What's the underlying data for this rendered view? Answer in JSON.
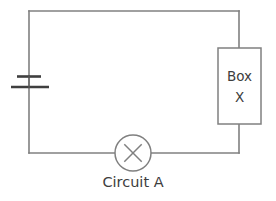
{
  "diagram": {
    "title": "Circuit A",
    "background_color": "#ffffff",
    "wire_color": "#808080",
    "component_color": "#808080",
    "battery_color": "#3f3f3f",
    "text_color": "#3d3d3d",
    "caption": {
      "text": "Circuit A",
      "x": 133,
      "y": 187
    },
    "loop": {
      "left": 29,
      "top": 11,
      "right": 239,
      "bottom": 153
    },
    "components": [
      {
        "type": "battery",
        "name": "battery",
        "x": 29,
        "y": 81,
        "long_plate_y": 87,
        "short_plate_y": 76,
        "long_plate_half_width": 19,
        "short_plate_half_width": 12
      },
      {
        "type": "box",
        "name": "box-x",
        "label_line_1": "Box",
        "label_line_2": "X",
        "x": 218,
        "y": 48,
        "width": 43,
        "height": 76
      },
      {
        "type": "lamp",
        "name": "lamp",
        "cx": 133,
        "cy": 153,
        "r": 18
      }
    ]
  }
}
